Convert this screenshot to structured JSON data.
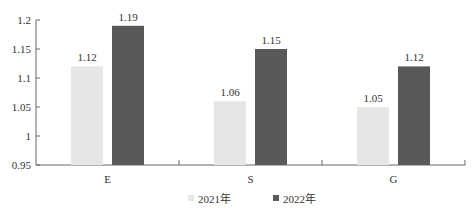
{
  "chart_data": {
    "type": "bar",
    "title": "",
    "xlabel": "",
    "ylabel": "",
    "categories": [
      "E",
      "S",
      "G"
    ],
    "series": [
      {
        "name": "2021年",
        "values": [
          1.12,
          1.06,
          1.05
        ],
        "color": "#e6e6e6"
      },
      {
        "name": "2022年",
        "values": [
          1.19,
          1.15,
          1.12
        ],
        "color": "#595959"
      }
    ],
    "ylim": [
      0.95,
      1.2
    ],
    "yticks": [
      "0.95",
      "1",
      "1.05",
      "1.1",
      "1.15",
      "1.2"
    ],
    "data_labels": [
      [
        "1.12",
        "1.06",
        "1.05"
      ],
      [
        "1.19",
        "1.15",
        "1.12"
      ]
    ],
    "grid": false,
    "legend_position": "bottom"
  },
  "legend": {
    "items": [
      {
        "label": "2021年",
        "color": "#e6e6e6"
      },
      {
        "label": "2022年",
        "color": "#595959"
      }
    ]
  }
}
